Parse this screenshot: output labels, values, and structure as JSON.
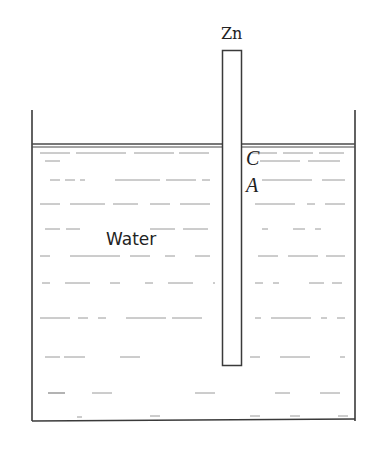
{
  "diagram": {
    "labels": {
      "electrode": "Zn",
      "point_c": "C",
      "point_a": "A",
      "liquid": "Water"
    },
    "colors": {
      "line": "#3a3a3a",
      "dash": "#8a8a8a",
      "background": "#ffffff"
    }
  }
}
